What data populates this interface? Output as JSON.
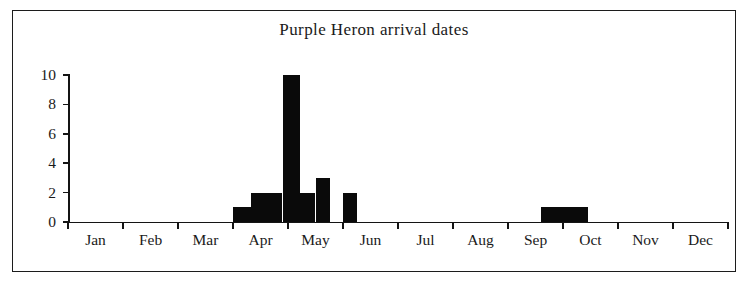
{
  "chart_data": {
    "type": "bar",
    "title": "Purple Heron arrival dates",
    "xlabel": "",
    "ylabel": "",
    "ylim": [
      0,
      10
    ],
    "yticks": [
      0,
      2,
      4,
      6,
      8,
      10
    ],
    "ytick_labels": [
      "0",
      "2",
      "4",
      "6",
      "8",
      "10"
    ],
    "xlim": [
      "Jan",
      "Dec"
    ],
    "grid": false,
    "legend": null,
    "categories": [
      "Jan",
      "Feb",
      "Mar",
      "Apr",
      "May",
      "Jun",
      "Jul",
      "Aug",
      "Sep",
      "Oct",
      "Nov",
      "Dec"
    ],
    "xtick_labels": [
      "Jan",
      "Feb",
      "Mar",
      "Apr",
      "May",
      "Jun",
      "Jul",
      "Aug",
      "Sep",
      "Oct",
      "Nov",
      "Dec"
    ],
    "bar_color": "#0a0a0a",
    "note": "Bars are sub-monthly (approx. weekly/ten-day) bins plotted along a 12-month axis.",
    "bins": [
      {
        "label": "late Mar",
        "x_start_month": 3.0,
        "x_end_month": 3.33,
        "value": 1
      },
      {
        "label": "early Apr",
        "x_start_month": 3.33,
        "x_end_month": 3.66,
        "value": 2
      },
      {
        "label": "mid Apr",
        "x_start_month": 3.66,
        "x_end_month": 3.9,
        "value": 2
      },
      {
        "label": "late Apr peak",
        "x_start_month": 3.9,
        "x_end_month": 4.22,
        "value": 10
      },
      {
        "label": "very late Apr",
        "x_start_month": 4.22,
        "x_end_month": 4.5,
        "value": 2
      },
      {
        "label": "early May",
        "x_start_month": 4.5,
        "x_end_month": 4.76,
        "value": 3
      },
      {
        "label": "mid May",
        "x_start_month": 5.0,
        "x_end_month": 5.25,
        "value": 2
      },
      {
        "label": "late Sep",
        "x_start_month": 8.6,
        "x_end_month": 9.45,
        "value": 1
      }
    ],
    "values_by_bin": [
      1,
      2,
      2,
      10,
      2,
      3,
      2,
      1
    ],
    "max_value": 10,
    "total_records": 23
  },
  "figure": {
    "frame_color": "#1c1c1c",
    "background": "#ffffff",
    "axis_color": "#141414"
  }
}
